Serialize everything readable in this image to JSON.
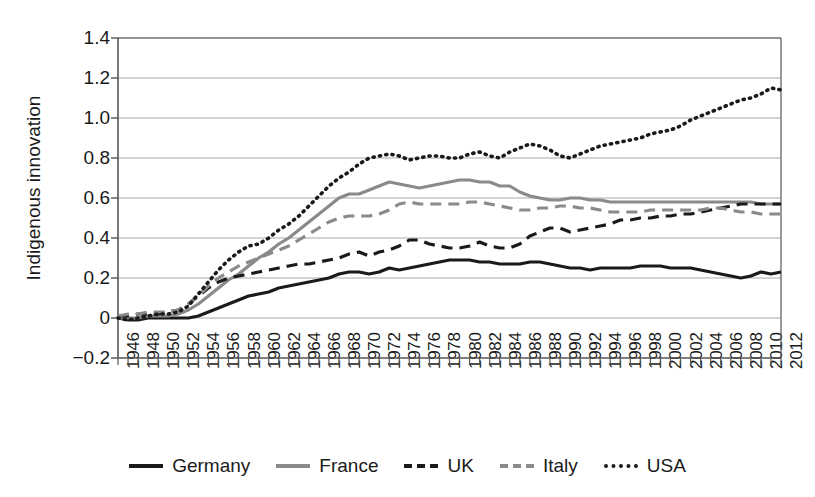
{
  "chart_data": {
    "type": "line",
    "title": "",
    "xlabel": "",
    "ylabel": "Indigenous innovation",
    "ylim": [
      -0.2,
      1.4
    ],
    "xlim": [
      1946,
      2012
    ],
    "yticks": [
      "1.4",
      "1.2",
      "1.0",
      "0.8",
      "0.6",
      "0.4",
      "0.2",
      "0",
      "-0.2"
    ],
    "ytick_values": [
      1.4,
      1.2,
      1.0,
      0.8,
      0.6,
      0.4,
      0.2,
      0,
      -0.2
    ],
    "grid": "horizontal",
    "legend_position": "bottom",
    "x": [
      1946,
      1947,
      1948,
      1949,
      1950,
      1951,
      1952,
      1953,
      1954,
      1955,
      1956,
      1957,
      1958,
      1959,
      1960,
      1961,
      1962,
      1963,
      1964,
      1965,
      1966,
      1967,
      1968,
      1969,
      1970,
      1971,
      1972,
      1973,
      1974,
      1975,
      1976,
      1977,
      1978,
      1979,
      1980,
      1981,
      1982,
      1983,
      1984,
      1985,
      1986,
      1987,
      1988,
      1989,
      1990,
      1991,
      1992,
      1993,
      1994,
      1995,
      1996,
      1997,
      1998,
      1999,
      2000,
      2001,
      2002,
      2003,
      2004,
      2005,
      2006,
      2007,
      2008,
      2009,
      2010,
      2011,
      2012
    ],
    "xticks": [
      "1946",
      "1948",
      "1950",
      "1952",
      "1954",
      "1956",
      "1958",
      "1960",
      "1962",
      "1964",
      "1966",
      "1968",
      "1970",
      "1972",
      "1974",
      "1976",
      "1978",
      "1980",
      "1982",
      "1984",
      "1986",
      "1988",
      "1990",
      "1992",
      "1994",
      "1996",
      "1998",
      "2000",
      "2002",
      "2004",
      "2006",
      "2008",
      "2010",
      "2012"
    ],
    "xtick_values": [
      1946,
      1948,
      1950,
      1952,
      1954,
      1956,
      1958,
      1960,
      1962,
      1964,
      1966,
      1968,
      1970,
      1972,
      1974,
      1976,
      1978,
      1980,
      1982,
      1984,
      1986,
      1988,
      1990,
      1992,
      1994,
      1996,
      1998,
      2000,
      2002,
      2004,
      2006,
      2008,
      2010,
      2012
    ],
    "series": [
      {
        "name": "Germany",
        "style": "solid",
        "color": "#1a1a1a",
        "width": 3.2,
        "values": [
          0.0,
          -0.01,
          -0.01,
          0.0,
          0.0,
          0.0,
          0.0,
          0.0,
          0.01,
          0.03,
          0.05,
          0.07,
          0.09,
          0.11,
          0.12,
          0.13,
          0.15,
          0.16,
          0.17,
          0.18,
          0.19,
          0.2,
          0.22,
          0.23,
          0.23,
          0.22,
          0.23,
          0.25,
          0.24,
          0.25,
          0.26,
          0.27,
          0.28,
          0.29,
          0.29,
          0.29,
          0.28,
          0.28,
          0.27,
          0.27,
          0.27,
          0.28,
          0.28,
          0.27,
          0.26,
          0.25,
          0.25,
          0.24,
          0.25,
          0.25,
          0.25,
          0.25,
          0.26,
          0.26,
          0.26,
          0.25,
          0.25,
          0.25,
          0.24,
          0.23,
          0.22,
          0.21,
          0.2,
          0.21,
          0.23,
          0.22,
          0.23
        ]
      },
      {
        "name": "France",
        "style": "solid",
        "color": "#8a8a8a",
        "width": 3.2,
        "values": [
          0.0,
          0.0,
          0.0,
          0.01,
          0.01,
          0.01,
          0.02,
          0.04,
          0.07,
          0.11,
          0.15,
          0.19,
          0.22,
          0.26,
          0.3,
          0.33,
          0.37,
          0.4,
          0.44,
          0.48,
          0.52,
          0.56,
          0.6,
          0.62,
          0.62,
          0.64,
          0.66,
          0.68,
          0.67,
          0.66,
          0.65,
          0.66,
          0.67,
          0.68,
          0.69,
          0.69,
          0.68,
          0.68,
          0.66,
          0.66,
          0.63,
          0.61,
          0.6,
          0.59,
          0.59,
          0.6,
          0.6,
          0.59,
          0.59,
          0.58,
          0.58,
          0.58,
          0.58,
          0.58,
          0.58,
          0.58,
          0.58,
          0.58,
          0.58,
          0.58,
          0.58,
          0.58,
          0.58,
          0.58,
          0.57,
          0.57,
          0.57
        ]
      },
      {
        "name": "UK",
        "style": "dashed",
        "color": "#1a1a1a",
        "width": 3.2,
        "values": [
          0.01,
          0.01,
          0.02,
          0.02,
          0.02,
          0.03,
          0.04,
          0.07,
          0.11,
          0.15,
          0.18,
          0.2,
          0.21,
          0.22,
          0.23,
          0.24,
          0.25,
          0.26,
          0.27,
          0.27,
          0.28,
          0.29,
          0.3,
          0.32,
          0.33,
          0.31,
          0.33,
          0.34,
          0.36,
          0.39,
          0.39,
          0.37,
          0.36,
          0.35,
          0.35,
          0.36,
          0.38,
          0.36,
          0.35,
          0.35,
          0.37,
          0.41,
          0.43,
          0.45,
          0.45,
          0.43,
          0.44,
          0.45,
          0.46,
          0.47,
          0.49,
          0.49,
          0.5,
          0.5,
          0.51,
          0.51,
          0.52,
          0.52,
          0.53,
          0.54,
          0.55,
          0.56,
          0.57,
          0.57,
          0.57,
          0.57,
          0.57
        ]
      },
      {
        "name": "Italy",
        "style": "dashed",
        "color": "#8a8a8a",
        "width": 3.2,
        "values": [
          0.01,
          0.02,
          0.02,
          0.03,
          0.03,
          0.03,
          0.04,
          0.07,
          0.11,
          0.16,
          0.2,
          0.23,
          0.26,
          0.28,
          0.3,
          0.32,
          0.34,
          0.36,
          0.39,
          0.42,
          0.45,
          0.48,
          0.5,
          0.51,
          0.51,
          0.51,
          0.52,
          0.54,
          0.57,
          0.58,
          0.57,
          0.57,
          0.57,
          0.57,
          0.57,
          0.58,
          0.58,
          0.57,
          0.56,
          0.55,
          0.54,
          0.54,
          0.55,
          0.55,
          0.56,
          0.56,
          0.55,
          0.55,
          0.54,
          0.53,
          0.53,
          0.53,
          0.53,
          0.54,
          0.54,
          0.54,
          0.54,
          0.54,
          0.54,
          0.55,
          0.55,
          0.54,
          0.53,
          0.53,
          0.52,
          0.52,
          0.52
        ]
      },
      {
        "name": "USA",
        "style": "dotted",
        "color": "#1a1a1a",
        "width": 3.6,
        "values": [
          0.0,
          -0.01,
          0.0,
          0.01,
          0.02,
          0.02,
          0.03,
          0.06,
          0.12,
          0.18,
          0.24,
          0.29,
          0.33,
          0.36,
          0.37,
          0.4,
          0.44,
          0.47,
          0.51,
          0.56,
          0.61,
          0.66,
          0.7,
          0.73,
          0.77,
          0.8,
          0.81,
          0.82,
          0.81,
          0.79,
          0.8,
          0.81,
          0.81,
          0.8,
          0.8,
          0.82,
          0.83,
          0.81,
          0.8,
          0.83,
          0.85,
          0.87,
          0.86,
          0.84,
          0.81,
          0.8,
          0.82,
          0.84,
          0.86,
          0.87,
          0.88,
          0.89,
          0.9,
          0.92,
          0.93,
          0.94,
          0.96,
          0.99,
          1.01,
          1.03,
          1.05,
          1.07,
          1.09,
          1.1,
          1.12,
          1.15,
          1.14
        ]
      }
    ]
  },
  "legend": {
    "items": [
      {
        "label": "Germany",
        "swatch": "solid-dark-line-icon"
      },
      {
        "label": "France",
        "swatch": "solid-gray-line-icon"
      },
      {
        "label": "UK",
        "swatch": "dashed-dark-line-icon"
      },
      {
        "label": "Italy",
        "swatch": "dashed-gray-line-icon"
      },
      {
        "label": "USA",
        "swatch": "dotted-dark-line-icon"
      }
    ]
  },
  "colors": {
    "dark": "#1a1a1a",
    "gray": "#8a8a8a",
    "grid": "#aaaaaa",
    "axis": "#555555",
    "background": "#ffffff"
  }
}
